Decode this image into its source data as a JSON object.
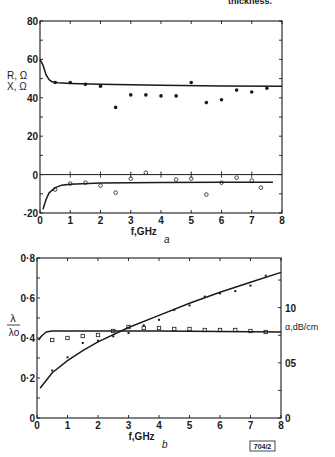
{
  "caption_fragment": "thickness.",
  "figure_id": "704/2",
  "chart_data": [
    {
      "panel": "a",
      "type": "scatter",
      "title": "",
      "panel_label": "a",
      "xlabel": "f,GHz",
      "ylabel": "R, Ω\nX, Ω",
      "ylabel_lines": [
        "R, Ω",
        "X, Ω"
      ],
      "xlim": [
        0,
        8
      ],
      "ylim": [
        -20,
        80
      ],
      "x_ticks": [
        0,
        1,
        2,
        3,
        4,
        5,
        6,
        7,
        8
      ],
      "y_tick_labels": [
        "80",
        "60",
        "40",
        "20",
        "0",
        "-20"
      ],
      "y_ticks": [
        80,
        60,
        40,
        20,
        0,
        -20
      ],
      "grid": false,
      "series": [
        {
          "name": "R measured",
          "marker": "filled-dot",
          "x": [
            0.5,
            1.0,
            1.5,
            2.0,
            2.5,
            3.0,
            3.5,
            4.0,
            4.5,
            5.0,
            5.5,
            6.0,
            6.5,
            7.0,
            7.5
          ],
          "y": [
            48,
            48,
            47,
            46,
            35,
            41.5,
            41.5,
            41,
            41,
            48,
            37.5,
            39,
            44,
            43,
            45
          ]
        },
        {
          "name": "R theory",
          "style": "line",
          "x": [
            0,
            0.1,
            0.2,
            0.3,
            0.4,
            0.6,
            1,
            2,
            4,
            6,
            8
          ],
          "y": [
            60,
            57,
            52,
            49.5,
            48.3,
            47.8,
            47.5,
            47,
            46.5,
            46.2,
            46
          ]
        },
        {
          "name": "X measured",
          "marker": "open-circle",
          "x": [
            0.5,
            1.0,
            1.5,
            2.0,
            2.5,
            3.0,
            3.5,
            4.5,
            5.0,
            5.5,
            6.0,
            6.5,
            7.0,
            7.3
          ],
          "y": [
            -7.8,
            -4.7,
            -4.2,
            -5.7,
            -9.4,
            -2.1,
            1,
            -2.6,
            -2.1,
            -10.4,
            -4.2,
            -1.6,
            -3.1,
            -6.8
          ]
        },
        {
          "name": "X theory",
          "style": "line",
          "x": [
            0.1,
            0.2,
            0.3,
            0.5,
            0.7,
            1,
            2,
            4,
            6,
            7.7
          ],
          "y": [
            -18,
            -13,
            -9.5,
            -6.8,
            -5.6,
            -5,
            -4.4,
            -4.1,
            -4,
            -4
          ]
        }
      ]
    },
    {
      "panel": "b",
      "type": "scatter",
      "title": "",
      "panel_label": "b",
      "xlabel": "f,GHz",
      "ylabel": "λ/λo",
      "ylabel_num": "λ",
      "ylabel_den": "λo",
      "y2label": "α,dB/cm",
      "xlim": [
        0,
        8
      ],
      "ylim": [
        0,
        0.8
      ],
      "y2lim": [
        0,
        14.5
      ],
      "x_ticks": [
        0,
        1,
        2,
        3,
        4,
        5,
        6,
        7,
        8
      ],
      "y_ticks": [
        0,
        0.2,
        0.4,
        0.6,
        0.8
      ],
      "y_tick_labels": [
        "0",
        "0·2",
        "0·4",
        "0·6",
        "0·8"
      ],
      "y2_ticks": [
        0,
        5,
        10
      ],
      "y2_tick_labels": [
        "0",
        "05",
        "10"
      ],
      "grid": false,
      "series": [
        {
          "name": "λ/λo measured",
          "axis": "left",
          "marker": "open-square",
          "x": [
            0.5,
            1.0,
            1.5,
            2.0,
            2.5,
            3.0,
            3.5,
            4.0,
            4.5,
            5.0,
            5.5,
            6.0,
            6.5,
            7.0,
            7.5
          ],
          "y": [
            0.39,
            0.4,
            0.41,
            0.415,
            0.435,
            0.455,
            0.45,
            0.45,
            0.445,
            0.445,
            0.44,
            0.44,
            0.44,
            0.435,
            0.43
          ]
        },
        {
          "name": "λ/λo theory",
          "axis": "left",
          "style": "line",
          "x": [
            0.05,
            0.15,
            0.3,
            0.5,
            1,
            2,
            4,
            6,
            8
          ],
          "y": [
            0.39,
            0.41,
            0.43,
            0.435,
            0.435,
            0.435,
            0.435,
            0.432,
            0.43
          ]
        },
        {
          "name": "α measured",
          "axis": "right",
          "marker": "cross",
          "x": [
            0.5,
            1.0,
            1.5,
            2.0,
            2.5,
            3.0,
            3.5,
            4.0,
            4.5,
            5.0,
            5.5,
            6.0,
            6.5,
            7.0,
            7.5
          ],
          "y": [
            4.3,
            5.5,
            6.8,
            7.0,
            7.4,
            7.7,
            8.4,
            8.9,
            9.8,
            10.2,
            11.0,
            11.3,
            11.5,
            12.0,
            12.9
          ]
        },
        {
          "name": "α theory",
          "axis": "right",
          "style": "line",
          "x": [
            0.1,
            0.5,
            1,
            1.5,
            2,
            3,
            4,
            5,
            6,
            7,
            8
          ],
          "y": [
            2.7,
            4.1,
            5.2,
            6.1,
            6.9,
            8.2,
            9.3,
            10.4,
            11.4,
            12.3,
            13.2
          ]
        }
      ]
    }
  ]
}
